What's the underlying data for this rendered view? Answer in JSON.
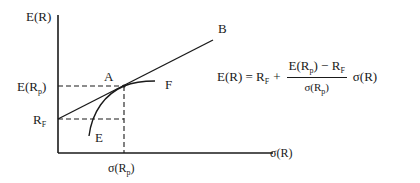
{
  "diagram": {
    "type": "capital-market-line",
    "y_axis_label": "E(R)",
    "x_axis_label": "σ(R)",
    "y_ticks": [
      {
        "base": "E(R",
        "sub": "p",
        "close": ")"
      },
      {
        "base": "R",
        "sub": "F",
        "close": ""
      }
    ],
    "x_ticks": [
      {
        "base": "σ(R",
        "sub": "p",
        "close": ")"
      }
    ],
    "points": {
      "A": "A",
      "B": "B",
      "E": "E",
      "F": "F"
    },
    "formula": {
      "lhs": "E(R) = R",
      "lhs_sub": "F",
      "plus": "+",
      "numerator_a": "E(R",
      "numerator_a_sub": "p",
      "numerator_b": ") − R",
      "numerator_b_sub": "F",
      "denominator": "σ(R",
      "denominator_sub": "p",
      "denominator_close": ")",
      "rhs": "σ(R)"
    },
    "colors": {
      "ink": "#1a1a1a",
      "background": "#ffffff"
    }
  }
}
